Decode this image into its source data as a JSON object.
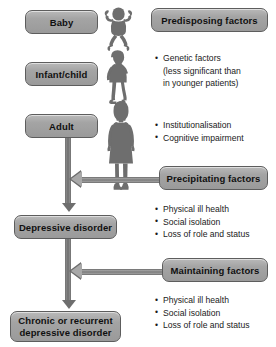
{
  "diagram": {
    "colors": {
      "box_fill": "#9a9a9a",
      "box_border": "#5d5d5d",
      "arrow": "#6e6e6e",
      "text": "#101010",
      "figure": "#6e6e6e",
      "background": "#ffffff"
    },
    "left_column": {
      "stages": [
        {
          "label": "Baby",
          "figure": "baby-silhouette-icon"
        },
        {
          "label": "Infant/child",
          "figure": "child-silhouette-icon"
        },
        {
          "label": "Adult",
          "figure": "adult-silhouette-icon"
        }
      ],
      "outcomes": [
        {
          "label": "Depressive disorder"
        },
        {
          "label_line1": "Chronic or recurrent",
          "label_line2": "depressive disorder"
        }
      ]
    },
    "right_column": {
      "factor_groups": [
        {
          "heading": "Predisposing factors",
          "items": [
            {
              "text": "Genetic factors",
              "bullet": true
            },
            {
              "text": "(less significant than",
              "bullet": false
            },
            {
              "text": "in younger patients)",
              "bullet": false
            }
          ]
        },
        {
          "heading": "Precipitating factors",
          "items": [
            {
              "text": "Institutionalisation",
              "bullet": true
            },
            {
              "text": "Cognitive impairment",
              "bullet": true
            }
          ]
        },
        {
          "heading": "Maintaining factors",
          "items": [
            {
              "text": "Physical ill health",
              "bullet": true
            },
            {
              "text": "Social isolation",
              "bullet": true
            },
            {
              "text": "Loss of role and status",
              "bullet": true
            }
          ]
        },
        {
          "heading": null,
          "items": [
            {
              "text": "Physical ill health",
              "bullet": true
            },
            {
              "text": "Social isolation",
              "bullet": true
            },
            {
              "text": "Loss of role and status",
              "bullet": true
            }
          ]
        }
      ]
    }
  }
}
